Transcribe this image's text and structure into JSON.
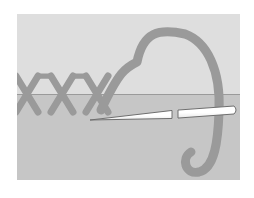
{
  "figure": {
    "title": "Cross-stitch embroidery diagram",
    "caption": "Threaded needle forming a row of cross stitches on fabric",
    "canvas": {
      "width": 254,
      "height": 198,
      "background": "#ffffff"
    }
  },
  "colors": {
    "page_background": "#ffffff",
    "fabric_upper": "#dedede",
    "fabric_lower": "#c6c6c6",
    "fabric_edge_line": "#9a9a9a",
    "thread": "#9a9a9a",
    "thread_shadow": "#8d8d8d",
    "needle_fill": "#ffffff",
    "needle_outline": "#6f6f6f"
  },
  "fabric": {
    "name": "fabric ground",
    "x": 17,
    "y": 14,
    "width": 223,
    "height": 166,
    "fold_line_y": 94,
    "upper_label": "fabric front",
    "lower_label": "fabric under side"
  },
  "stitches": {
    "label": "cross stitch row",
    "count": 3,
    "arm_width": 7,
    "centers_x": [
      27,
      62,
      97
    ],
    "top_y": 76,
    "bottom_y": 112,
    "spread": 22
  },
  "thread": {
    "label": "working thread",
    "loop_apex": {
      "x": 185,
      "y": 30
    },
    "loop_left": {
      "x": 137,
      "y": 62
    },
    "tail_end": {
      "x": 205,
      "y": 172
    },
    "stroke_width": 9
  },
  "needle": {
    "label": "sewing needle",
    "tip": {
      "x": 90,
      "y": 120
    },
    "eye_end": {
      "x": 238,
      "y": 110
    },
    "length": 148,
    "max_thickness": 8,
    "gap_start_x": 172,
    "gap_end_x": 178
  },
  "chart_data": {
    "type": "diagram",
    "title": "Cross-stitch embroidery diagram",
    "elements": [
      {
        "name": "fabric ground",
        "kind": "surface",
        "value": "two-tone gray panel split by a horizontal fold line"
      },
      {
        "name": "cross stitch row",
        "kind": "stitching",
        "value": "3 completed X-shaped cross stitches along the fold line"
      },
      {
        "name": "working thread",
        "kind": "thread",
        "value": "large arched loop rising above the fabric and descending into a hooked tail"
      },
      {
        "name": "sewing needle",
        "kind": "tool",
        "value": "long tapered needle lying horizontally, passing under the thread"
      }
    ]
  }
}
